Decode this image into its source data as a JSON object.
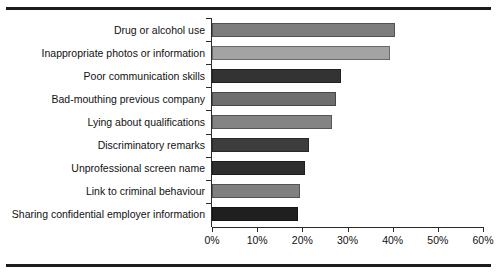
{
  "chart_data": {
    "type": "bar",
    "orientation": "horizontal",
    "title": "",
    "subtitle": "",
    "xlabel": "",
    "ylabel": "",
    "xlim": [
      0,
      60
    ],
    "grid": false,
    "legend": null,
    "xtick_labels": [
      "0%",
      "10%",
      "20%",
      "30%",
      "40%",
      "50%",
      "60%"
    ],
    "xtick_values": [
      0,
      10,
      20,
      30,
      40,
      50,
      60
    ],
    "categories": [
      "Drug or alcohol use",
      "Inappropriate photos or information",
      "Poor communication skills",
      "Bad-mouthing previous company",
      "Lying about qualifications",
      "Discriminatory remarks",
      "Unprofessional screen name",
      "Link to criminal behaviour",
      "Sharing confidential employer information"
    ],
    "values": [
      40.5,
      39.5,
      28.5,
      27.5,
      26.5,
      21.5,
      20.5,
      19.5,
      19.0
    ],
    "bar_colors": [
      "#7d7d7d",
      "#a3a3a3",
      "#333333",
      "#6e6e6e",
      "#848484",
      "#3d3d3d",
      "#2e2e2e",
      "#808080",
      "#1f1f1f"
    ]
  },
  "decor": {
    "top_rule_color": "#1c1c1c",
    "bottom_rule_color": "#1c1c1c",
    "axis_color": "#2b2b2b",
    "background": "#ffffff"
  }
}
